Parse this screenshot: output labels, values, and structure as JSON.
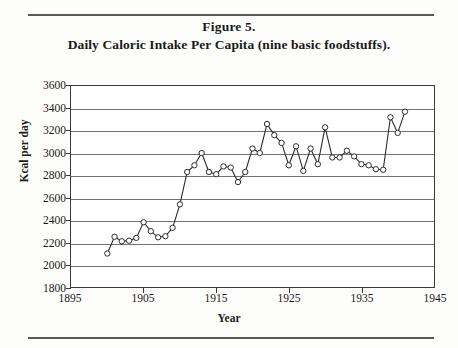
{
  "figure": {
    "label": "Figure 5.",
    "caption": "Daily Caloric Intake Per Capita (nine basic foodstuffs)."
  },
  "colors": {
    "line": "#2b2b2b",
    "marker_fill": "#ffffff",
    "marker_stroke": "#2b2b2b",
    "grid": "#6e7376",
    "axis": "#3a3a3a",
    "rule": "#555a5c",
    "text": "#1a1a1a",
    "background": "#fdfdfc"
  },
  "chart_data": {
    "type": "line",
    "title": "Daily Caloric Intake Per Capita (nine basic foodstuffs).",
    "xlabel": "Year",
    "ylabel": "Kcal per day",
    "xlim": [
      1895,
      1945
    ],
    "ylim": [
      1800,
      3600
    ],
    "xticks": [
      1895,
      1905,
      1915,
      1925,
      1935,
      1945
    ],
    "yticks": [
      1800,
      2000,
      2200,
      2400,
      2600,
      2800,
      3000,
      3200,
      3400,
      3600
    ],
    "grid": true,
    "legend": null,
    "marker": "open-circle",
    "series": [
      {
        "name": "Daily caloric intake per capita",
        "x": [
          1900,
          1901,
          1902,
          1903,
          1904,
          1905,
          1906,
          1907,
          1908,
          1909,
          1910,
          1911,
          1912,
          1913,
          1914,
          1915,
          1916,
          1917,
          1918,
          1919,
          1920,
          1921,
          1922,
          1923,
          1924,
          1925,
          1926,
          1927,
          1928,
          1929,
          1930,
          1931,
          1932,
          1933,
          1934,
          1935,
          1936,
          1937,
          1938,
          1939,
          1940,
          1941
        ],
        "y": [
          2100,
          2250,
          2210,
          2215,
          2240,
          2380,
          2300,
          2245,
          2255,
          2330,
          2540,
          2830,
          2890,
          3000,
          2830,
          2810,
          2880,
          2870,
          2740,
          2830,
          3040,
          3000,
          3260,
          3160,
          3090,
          2890,
          3060,
          2840,
          3040,
          2900,
          3230,
          2960,
          2960,
          3020,
          2970,
          2900,
          2890,
          2855,
          2850,
          3320,
          3180,
          3370
        ]
      }
    ]
  }
}
